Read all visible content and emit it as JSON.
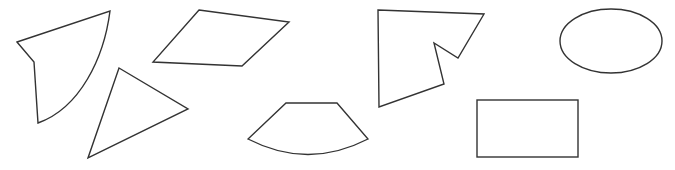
{
  "canvas": {
    "width": 675,
    "height": 170,
    "background": "#ffffff"
  },
  "style": {
    "stroke": "#333333",
    "stroke_width": 1.4
  },
  "shapes": [
    {
      "id": "curved-quadrilateral",
      "type": "path",
      "d": "M17 42 L110 11 C104 58 80 108 38 123 L34 62 Z"
    },
    {
      "id": "triangle",
      "type": "path",
      "d": "M119 68 L188 109 L88 158 Z"
    },
    {
      "id": "parallelogram",
      "type": "path",
      "d": "M199 10 L289 22 L242 66 L153 62 Z"
    },
    {
      "id": "concave-polygon",
      "type": "path",
      "d": "M378 10 L484 14 L458 58 L434 43 L444 84 L379 107 Z"
    },
    {
      "id": "annular-sector",
      "type": "path",
      "d": "M286 103 L337 103 L368 139 Q308 170 248 139 Z"
    },
    {
      "id": "ellipse",
      "type": "ellipse",
      "cx": 611,
      "cy": 41,
      "rx": 51,
      "ry": 32
    },
    {
      "id": "rectangle",
      "type": "rect",
      "x": 477,
      "y": 100,
      "width": 101,
      "height": 57
    }
  ]
}
